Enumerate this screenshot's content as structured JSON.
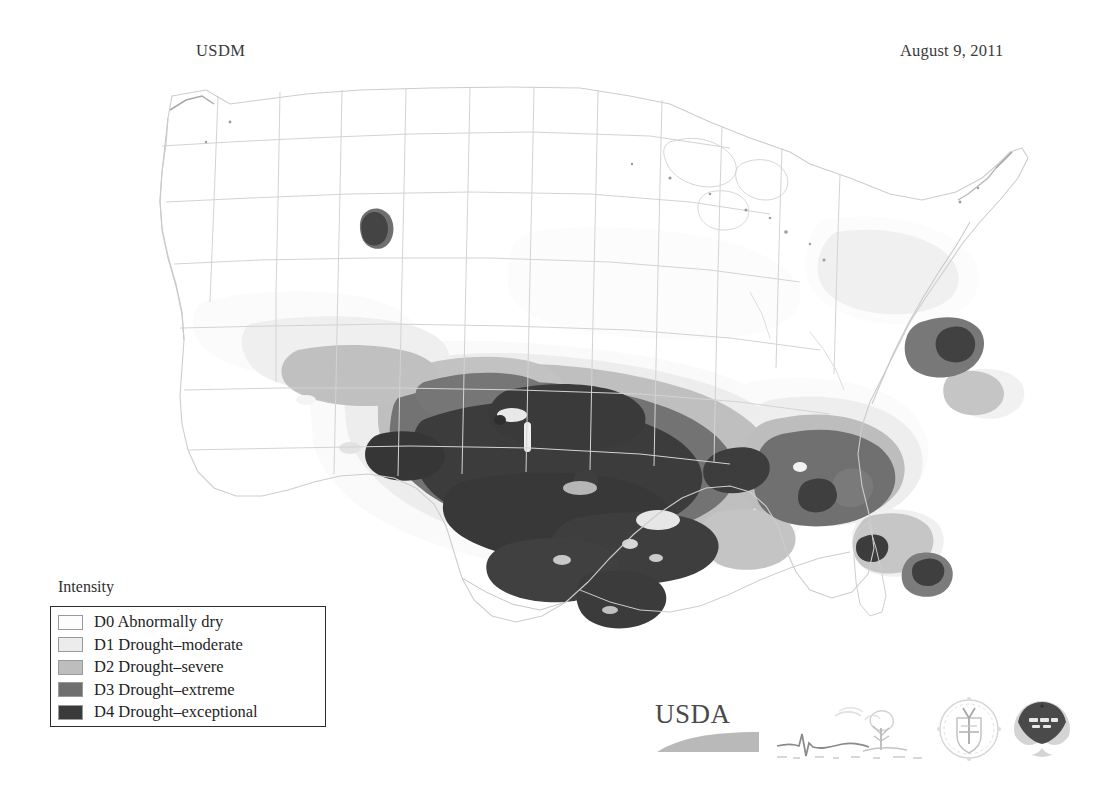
{
  "header": {
    "title": "USDM",
    "date": "August 9, 2011"
  },
  "legend": {
    "title": "Intensity",
    "items": [
      {
        "code": "D0",
        "label": "D0 Abnormally dry",
        "color": "#fdfdfd"
      },
      {
        "code": "D1",
        "label": "D1 Drought–moderate",
        "color": "#ececec"
      },
      {
        "code": "D2",
        "label": "D2 Drought–severe",
        "color": "#bdbdbd"
      },
      {
        "code": "D3",
        "label": "D3 Drought–extreme",
        "color": "#6f6f6f"
      },
      {
        "code": "D4",
        "label": "D4 Drought–exceptional",
        "color": "#3a3a3a"
      }
    ]
  },
  "logos": {
    "usda_text": "USDA",
    "items": [
      {
        "name": "usda-logo",
        "alt": "USDA"
      },
      {
        "name": "sketch-logo",
        "alt": "drought sketch"
      },
      {
        "name": "ndmc-seal",
        "alt": "National Drought Mitigation Center seal"
      },
      {
        "name": "noaa-logo",
        "alt": "NOAA"
      }
    ]
  },
  "map": {
    "type": "choropleth",
    "region": "Continental United States",
    "colors": {
      "background": "#ffffff",
      "border": "#d8d8d8",
      "coast": "#cfcfcf",
      "D0": "#fafafa",
      "D1": "#ededed",
      "D2": "#bfbfbf",
      "D3": "#737373",
      "D4": "#3c3c3c"
    },
    "notes": "Drought Monitor for August 9, 2011. Severe-to-exceptional drought centered on Texas, Oklahoma, Louisiana, New Mexico and Arkansas; a secondary D3 core over Georgia/Alabama; isolated spots in Florida, coastal Carolinas and the Pacific Northwest."
  }
}
